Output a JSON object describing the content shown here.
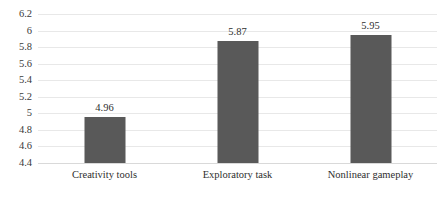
{
  "chart_data": {
    "type": "bar",
    "title": "",
    "xlabel": "",
    "ylabel": "",
    "categories": [
      "Creativity tools",
      "Exploratory task",
      "Nonlinear gameplay"
    ],
    "values": [
      4.96,
      5.87,
      5.95
    ],
    "value_labels": [
      "4.96",
      "5.87",
      "5.95"
    ],
    "ylim": [
      4.4,
      6.2
    ],
    "yticks": [
      6.2,
      6,
      5.8,
      5.6,
      5.4,
      5.2,
      5,
      4.8,
      4.6,
      4.4
    ],
    "ytick_labels": [
      "6.2",
      "6",
      "5.8",
      "5.6",
      "5.4",
      "5.2",
      "5",
      "4.8",
      "4.6",
      "4.4"
    ],
    "grid": true,
    "grid_axis": "y",
    "legend": false,
    "legend_position": "none",
    "bar_color": "#595959",
    "gridline_color": "#e8e8e8",
    "text_color": "#2e2e2e",
    "background_color": "#ffffff"
  }
}
